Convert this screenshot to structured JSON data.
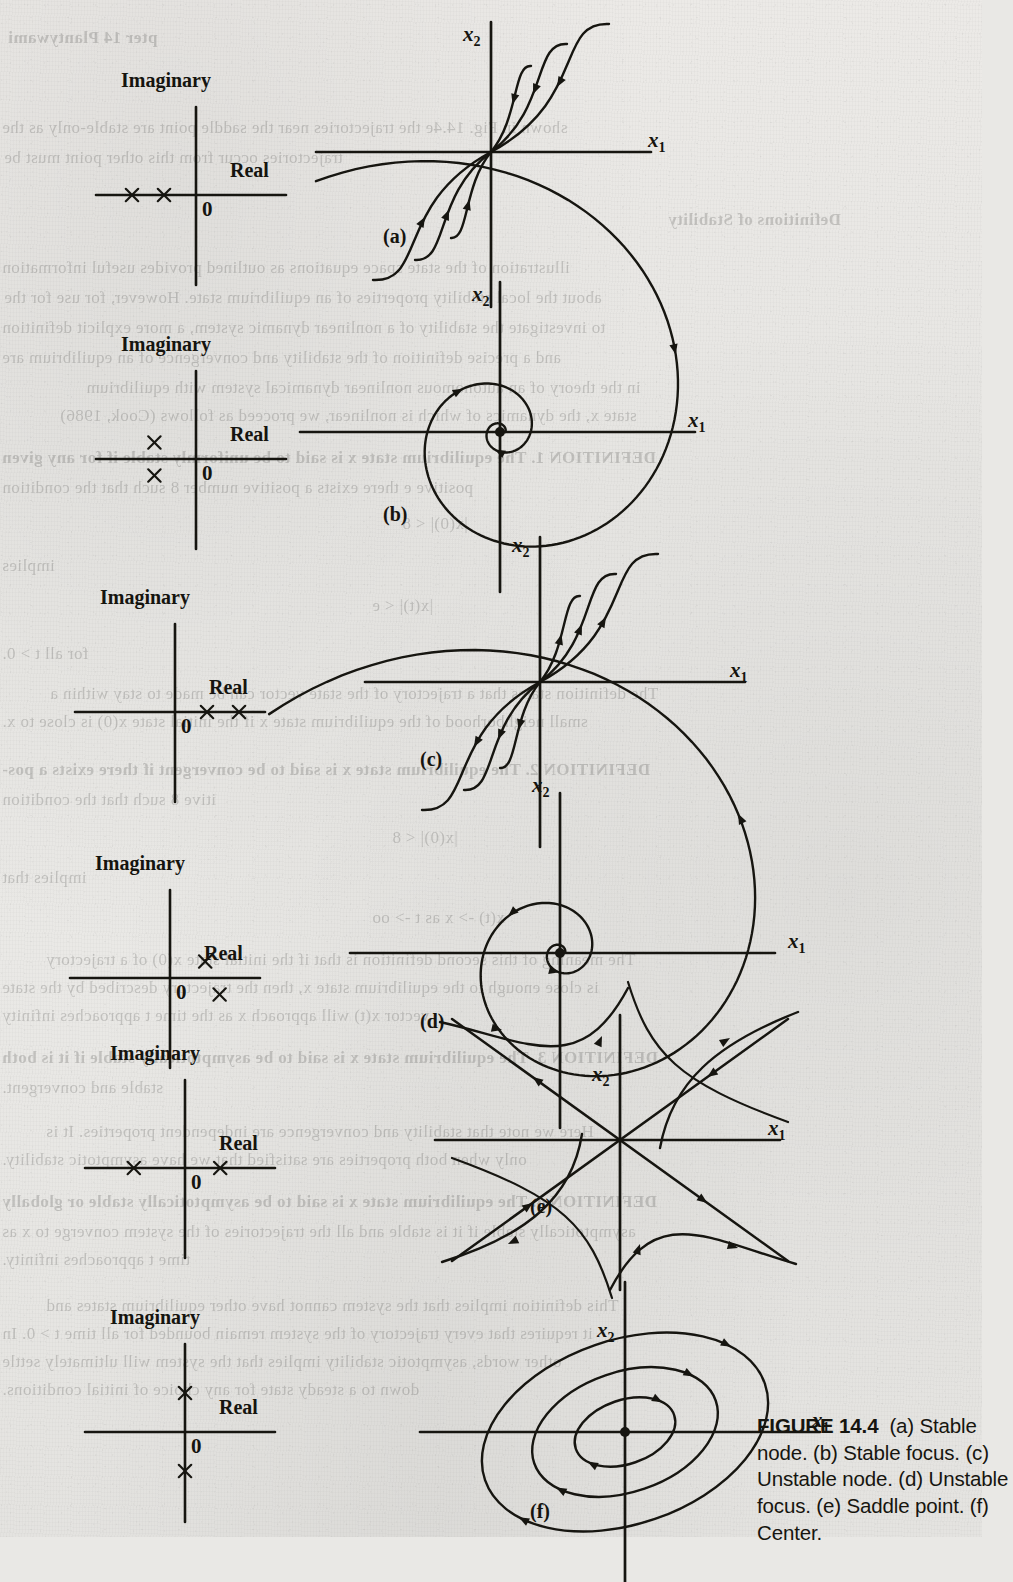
{
  "figure": {
    "number_label": "FIGURE 14.4",
    "caption_parts": [
      "(a) Stable node.",
      "(b) Stable focus.",
      "(c) Unstable node.",
      "(d) Unstable focus.",
      "(e) Saddle point.",
      "(f) Center."
    ],
    "caption_visible_text": "FIGURE 14.4 (a) Sta (b) Stable focus. (c) U node. (d) Unstable f (e) Saddle point. (f) ",
    "caption_clipped": "right edge of caption is cut off by page margin"
  },
  "axis_labels": {
    "imaginary": "Imaginary",
    "real": "Real",
    "origin": "0",
    "x1": "x",
    "x1_sub": "1",
    "x2": "x",
    "x2_sub": "2"
  },
  "panels": [
    {
      "key": "a",
      "label": "(a)",
      "name": "Stable node",
      "poles": [
        {
          "re": -2.0,
          "im": 0.0
        },
        {
          "re": -1.0,
          "im": 0.0
        }
      ],
      "pole_marker": "x",
      "phase_type": "node",
      "direction": "inward",
      "origin_marker": "none"
    },
    {
      "key": "b",
      "label": "(b)",
      "name": "Stable focus",
      "poles": [
        {
          "re": -1.3,
          "im": 0.55
        },
        {
          "re": -1.3,
          "im": -0.55
        }
      ],
      "pole_marker": "x",
      "phase_type": "spiral",
      "direction": "inward",
      "origin_marker": "dot"
    },
    {
      "key": "c",
      "label": "(c)",
      "name": "Unstable node",
      "poles": [
        {
          "re": 1.0,
          "im": 0.0
        },
        {
          "re": 2.0,
          "im": 0.0
        }
      ],
      "pole_marker": "x",
      "phase_type": "node",
      "direction": "outward",
      "origin_marker": "none"
    },
    {
      "key": "d",
      "label": "(d)",
      "name": "Unstable focus",
      "poles": [
        {
          "re": 1.1,
          "im": 0.55
        },
        {
          "re": 1.55,
          "im": -0.55
        }
      ],
      "pole_marker": "x",
      "phase_type": "spiral",
      "direction": "outward",
      "origin_marker": "dot"
    },
    {
      "key": "e",
      "label": "(e)",
      "name": "Saddle point",
      "poles": [
        {
          "re": -1.6,
          "im": 0.0
        },
        {
          "re": 1.1,
          "im": 0.0
        }
      ],
      "pole_marker": "x",
      "phase_type": "saddle",
      "direction": "mixed",
      "origin_marker": "none"
    },
    {
      "key": "f",
      "label": "(f)",
      "name": "Center",
      "poles": [
        {
          "re": 0.0,
          "im": 1.3
        },
        {
          "re": 0.0,
          "im": -1.3
        }
      ],
      "pole_marker": "x",
      "phase_type": "center",
      "direction": "closed orbits",
      "origin_marker": "dot"
    }
  ],
  "bleedthrough": [
    {
      "x": 8,
      "y": 28,
      "text": "pter 14   Plantywami",
      "bold": true
    },
    {
      "x": 2,
      "y": 118,
      "text": "shown in Fig. 14.4e the trajectories near the saddle point are stable-only as the",
      "bold": false
    },
    {
      "x": 4,
      "y": 148,
      "text": "trajectories occur from this other point must be",
      "bold": false
    },
    {
      "x": 668,
      "y": 210,
      "text": "Definitions of Stability",
      "bold": true
    },
    {
      "x": 2,
      "y": 258,
      "text": "illustration of the state space equations as outlined  provides useful information",
      "bold": false
    },
    {
      "x": 4,
      "y": 288,
      "text": "about the local stability properties of an equilibrium state. However, for use for the",
      "bold": false
    },
    {
      "x": 2,
      "y": 318,
      "text": "to investigate the stability of a nonlinear dynamic system, a more explicit definition",
      "bold": false
    },
    {
      "x": 2,
      "y": 348,
      "text": "and a precise definition of the stability and convergence of an equilibrium are",
      "bold": false
    },
    {
      "x": 86,
      "y": 378,
      "text": "in the theory of an autonomous nonlinear dynamical system with equilibrium",
      "bold": false
    },
    {
      "x": 60,
      "y": 406,
      "text": "state x, the dynamics of which is nonlinear, we proceed as follows (Cook, 1986)",
      "bold": false
    },
    {
      "x": 2,
      "y": 448,
      "text": "DEFINITION 1.  The equilibrium state x is said to be uniformly stable if for any given",
      "bold": true
    },
    {
      "x": 2,
      "y": 478,
      "text": "positive e there exists a positive number 8 such that the condition",
      "bold": false
    },
    {
      "x": 402,
      "y": 514,
      "text": "|x(0)| < 8",
      "bold": false
    },
    {
      "x": 2,
      "y": 556,
      "text": "implies",
      "bold": false
    },
    {
      "x": 372,
      "y": 596,
      "text": "|x(t)| < e",
      "bold": false
    },
    {
      "x": 2,
      "y": 644,
      "text": "for all t > 0.",
      "bold": false
    },
    {
      "x": 50,
      "y": 684,
      "text": "The definition states that a trajectory of the state vector can be made to stay within a",
      "bold": false
    },
    {
      "x": 2,
      "y": 712,
      "text": "small neighborhood of the equilibrium state x if the initial state x(0) is close to x.",
      "bold": false
    },
    {
      "x": 2,
      "y": 760,
      "text": "DEFINITION 2.  The equilibrium state x is said to be convergent if there exists a pos-",
      "bold": true
    },
    {
      "x": 2,
      "y": 790,
      "text": "itive 8 such that the condition",
      "bold": false
    },
    {
      "x": 392,
      "y": 828,
      "text": "|x(0)| < 8",
      "bold": false
    },
    {
      "x": 2,
      "y": 868,
      "text": "implies that",
      "bold": false
    },
    {
      "x": 372,
      "y": 908,
      "text": "x(t) -> x   as  t -> oo",
      "bold": false
    },
    {
      "x": 46,
      "y": 950,
      "text": "The meaning of this second definition is that if the initial state x(0) of a trajectory",
      "bold": false
    },
    {
      "x": 2,
      "y": 978,
      "text": "is close enough to the equilibrium state x, then the trajectory described by the state",
      "bold": false
    },
    {
      "x": 2,
      "y": 1006,
      "text": "vector x(t) will approach x as the time t approaches infinity",
      "bold": false
    },
    {
      "x": 2,
      "y": 1048,
      "text": "DEFINITION 3.  The equilibrium state x is said to be asymptotically stable if it is both",
      "bold": true
    },
    {
      "x": 2,
      "y": 1078,
      "text": "stable and convergent.",
      "bold": false
    },
    {
      "x": 46,
      "y": 1122,
      "text": "Here we note that stability and convergence are independent properties. It is",
      "bold": false
    },
    {
      "x": 2,
      "y": 1150,
      "text": "only when both properties are satisfied that we have asymptotic stability.",
      "bold": false
    },
    {
      "x": 2,
      "y": 1192,
      "text": "DEFINITION 4.  The equilibrium state x is said to be asymptotically stable or globally",
      "bold": true
    },
    {
      "x": 2,
      "y": 1222,
      "text": "asymptotically stable if it is stable and all the trajectories of the system converge to x as",
      "bold": false
    },
    {
      "x": 2,
      "y": 1250,
      "text": "time t approaches infinity.",
      "bold": false
    },
    {
      "x": 46,
      "y": 1296,
      "text": "This definition implies that the system cannot have other equilibrium states and",
      "bold": false
    },
    {
      "x": 2,
      "y": 1324,
      "text": "it requires that every trajectory of the system remain bounded for all time t > 0. In",
      "bold": false
    },
    {
      "x": 2,
      "y": 1352,
      "text": "other words, asymptotic stability implies that the system will ultimately settle",
      "bold": false
    },
    {
      "x": 2,
      "y": 1380,
      "text": "down to a steady state for any choice of initial conditions.",
      "bold": false
    }
  ]
}
